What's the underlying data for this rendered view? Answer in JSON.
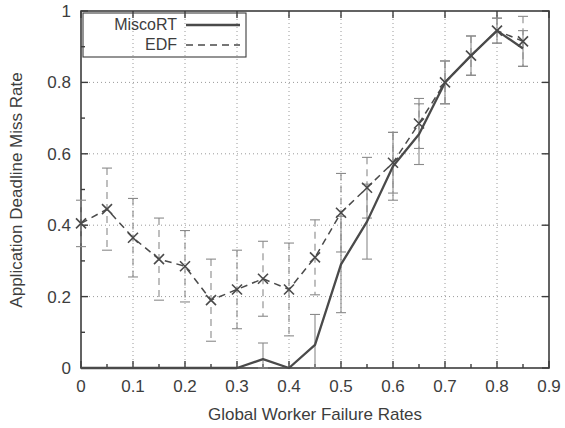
{
  "chart_data": {
    "type": "line",
    "title": "",
    "subtitle": "",
    "xlabel": "Global Worker Failure Rates",
    "ylabel": "Application Deadline Miss Rate",
    "xlim": [
      0,
      0.9
    ],
    "ylim": [
      0,
      1
    ],
    "xticks": [
      0,
      0.1,
      0.2,
      0.3,
      0.4,
      0.5,
      0.6,
      0.7,
      0.8,
      0.9
    ],
    "xtick_labels": [
      "0",
      "0.1",
      "0.2",
      "0.3",
      "0.4",
      "0.5",
      "0.6",
      "0.7",
      "0.8",
      "0.9"
    ],
    "yticks": [
      0,
      0.2,
      0.4,
      0.6,
      0.8,
      1
    ],
    "ytick_labels": [
      "0",
      "0.2",
      "0.4",
      "0.6",
      "0.8",
      "1"
    ],
    "minor_xtick_step": 0.05,
    "minor_ytick_step": 0.1,
    "grid": true,
    "grid_style": "dotted",
    "legend_position": "top-left",
    "line_color": "#4a4a4a",
    "errorbar_color": "#8a8a8a",
    "grid_color": "#9a9a9a",
    "axis_color": "#3d3d3d",
    "x": [
      0,
      0.05,
      0.1,
      0.15,
      0.2,
      0.25,
      0.3,
      0.35,
      0.4,
      0.45,
      0.5,
      0.55,
      0.6,
      0.65,
      0.7,
      0.75,
      0.8,
      0.85
    ],
    "series": [
      {
        "name": "MiscoRT",
        "style": "solid",
        "marker": "none",
        "values": [
          0,
          0,
          0,
          0,
          0,
          0,
          0,
          0.025,
          0,
          0.065,
          0.29,
          0.41,
          0.565,
          0.655,
          0.8,
          0.875,
          0.945,
          0.895
        ],
        "errors": [
          0,
          0,
          0,
          0,
          0,
          0,
          0,
          0.045,
          0,
          0.085,
          0.135,
          0.105,
          0.095,
          0.085,
          0.06,
          0.055,
          0.035,
          0.05
        ]
      },
      {
        "name": "EDF",
        "style": "dashed",
        "marker": "x",
        "values": [
          0.405,
          0.445,
          0.365,
          0.305,
          0.285,
          0.19,
          0.22,
          0.25,
          0.22,
          0.31,
          0.435,
          0.505,
          0.575,
          0.685,
          0.8,
          0.875,
          0.945,
          0.915
        ],
        "errors": [
          0.065,
          0.115,
          0.11,
          0.115,
          0.1,
          0.115,
          0.11,
          0.105,
          0.13,
          0.105,
          0.11,
          0.085,
          0.085,
          0.07,
          0.06,
          0.055,
          0.035,
          0.07
        ]
      }
    ]
  },
  "legend": {
    "entries": [
      {
        "label": "MiscoRT",
        "style": "solid"
      },
      {
        "label": "EDF",
        "style": "dashed"
      }
    ]
  }
}
